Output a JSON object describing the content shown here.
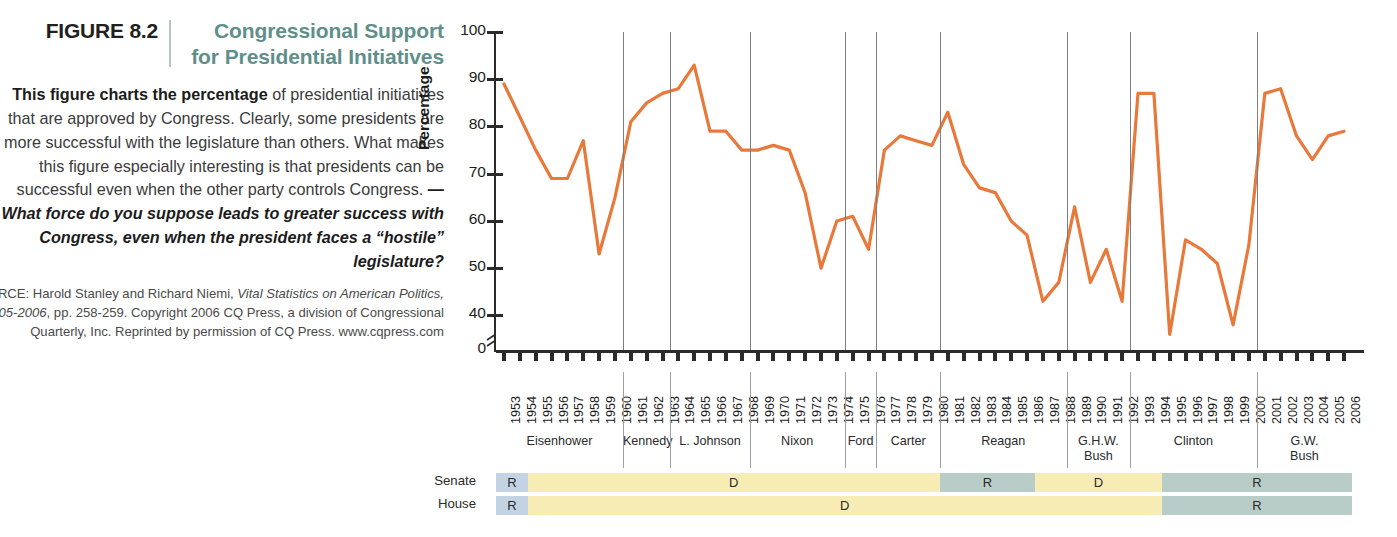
{
  "caption": {
    "figure_number": "FIGURE 8.2",
    "title": "Congressional Support for Presidential Initiatives",
    "body_lead": "This figure charts the percentage",
    "body_rest": " of presidential initiatives that are approved by Congress. Clearly, some presidents are more successful with the legislature than others. What makes this figure especially interesting is that presidents can be successful even when the other party controls Congress. ",
    "body_question": "—What force do you suppose leads to greater success with Congress, even when the president faces a “hostile” legislature?",
    "source_prefix": "SOURCE: Harold Stanley and Richard Niemi, ",
    "source_italic1": "Vital Statistics on American Politics, 2005-2006",
    "source_rest": ", pp. 258-259. Copyright 2006 CQ Press, a division of Congressional Quarterly, Inc. Reprinted by permission of CQ Press. www.cqpress.com"
  },
  "chart_data": {
    "type": "line",
    "title": "Congressional Support for Presidential Initiatives",
    "xlabel": "",
    "ylabel": "Percentage",
    "ylim": [
      0,
      100
    ],
    "yticks": [
      0,
      40,
      50,
      60,
      70,
      80,
      90,
      100
    ],
    "ytick_labels": [
      "0",
      "40",
      "50",
      "60",
      "70",
      "80",
      "90",
      "100"
    ],
    "y_axis_break": true,
    "grid": false,
    "legend": "none",
    "line_color": "#E8793A",
    "x": [
      1953,
      1954,
      1955,
      1956,
      1957,
      1958,
      1959,
      1960,
      1961,
      1962,
      1963,
      1964,
      1965,
      1966,
      1967,
      1968,
      1969,
      1970,
      1971,
      1972,
      1973,
      1974,
      1975,
      1976,
      1977,
      1978,
      1979,
      1980,
      1981,
      1982,
      1983,
      1984,
      1985,
      1986,
      1987,
      1988,
      1989,
      1990,
      1991,
      1992,
      1993,
      1994,
      1995,
      1996,
      1997,
      1998,
      1999,
      2000,
      2001,
      2002,
      2003,
      2004,
      2005,
      2006
    ],
    "xtick_labels": [
      "1953",
      "1954",
      "1955",
      "1956",
      "1957",
      "1958",
      "1959",
      "1960",
      "1961",
      "1962",
      "1963",
      "1964",
      "1965",
      "1966",
      "1967",
      "1968",
      "1969",
      "1970",
      "1971",
      "1972",
      "1973",
      "1974",
      "1975",
      "1976",
      "1977",
      "1978",
      "1979",
      "1980",
      "1981",
      "1982",
      "1983",
      "1984",
      "1985",
      "1986",
      "1987",
      "1988",
      "1989",
      "1990",
      "1991",
      "1992",
      "1993",
      "1994",
      "1995",
      "1996",
      "1997",
      "1998",
      "1999",
      "2000",
      "2001",
      "2002",
      "2003",
      "2004",
      "2005",
      "2006"
    ],
    "values": [
      89,
      82,
      75,
      69,
      69,
      77,
      53,
      65,
      81,
      85,
      87,
      88,
      93,
      79,
      79,
      75,
      75,
      76,
      75,
      66,
      50,
      60,
      61,
      54,
      75,
      78,
      77,
      76,
      83,
      72,
      67,
      66,
      60,
      57,
      43,
      47,
      63,
      47,
      54,
      43,
      87,
      87,
      36,
      56,
      54,
      51,
      38,
      55,
      87,
      88,
      78,
      73,
      78,
      79
    ],
    "annotations": []
  },
  "presidents": [
    {
      "name": "Eisenhower",
      "start": 1953,
      "end": 1960
    },
    {
      "name": "Kennedy",
      "start": 1961,
      "end": 1963
    },
    {
      "name": "L. Johnson",
      "start": 1964,
      "end": 1968
    },
    {
      "name": "Nixon",
      "start": 1969,
      "end": 1974
    },
    {
      "name": "Ford",
      "start": 1975,
      "end": 1976
    },
    {
      "name": "Carter",
      "start": 1977,
      "end": 1980
    },
    {
      "name": "Reagan",
      "start": 1981,
      "end": 1988
    },
    {
      "name": "G.H.W. Bush",
      "start": 1989,
      "end": 1992
    },
    {
      "name": "Clinton",
      "start": 1993,
      "end": 2000
    },
    {
      "name": "G.W. Bush",
      "start": 2001,
      "end": 2006
    }
  ],
  "party_control": {
    "senate_label": "Senate",
    "house_label": "House",
    "senate": [
      {
        "party": "R",
        "start": 1953,
        "end": 1954,
        "color": "#c3d3e4"
      },
      {
        "party": "D",
        "start": 1955,
        "end": 1980,
        "color": "#f7edb4"
      },
      {
        "party": "R",
        "start": 1981,
        "end": 1986,
        "color": "#b8ccc8"
      },
      {
        "party": "D",
        "start": 1987,
        "end": 1994,
        "color": "#f7edb4"
      },
      {
        "party": "R",
        "start": 1995,
        "end": 2006,
        "color": "#b8ccc8"
      }
    ],
    "house": [
      {
        "party": "R",
        "start": 1953,
        "end": 1954,
        "color": "#c3d3e4"
      },
      {
        "party": "D",
        "start": 1955,
        "end": 1994,
        "color": "#f7edb4"
      },
      {
        "party": "R",
        "start": 1995,
        "end": 2006,
        "color": "#b8ccc8"
      }
    ]
  },
  "colors": {
    "line": "#E8793A",
    "title": "#5f8f8b",
    "republican_early": "#c3d3e4",
    "republican": "#b8ccc8",
    "democrat": "#f7edb4",
    "axis": "#2b2b2b",
    "divider": "#7b7f82"
  }
}
